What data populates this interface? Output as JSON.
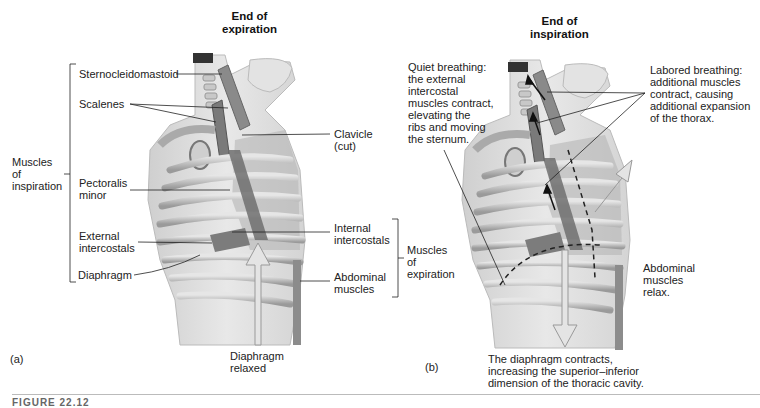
{
  "panel_a": {
    "label": "(a)",
    "title": "End of\nexpiration",
    "group_inspiration": "Muscles\nof\ninspiration",
    "group_expiration": "Muscles\nof\nexpiration",
    "labels": {
      "sternocleidomastoid": "Sternocleidomastoid",
      "scalenes": "Scalenes",
      "clavicle": "Clavicle\n(cut)",
      "pectoralis_minor": "Pectoralis\nminor",
      "external_intercostals": "External\nintercostals",
      "internal_intercostals": "Internal\nintercostals",
      "diaphragm": "Diaphragm",
      "abdominal_muscles": "Abdominal\nmuscles",
      "diaphragm_relaxed": "Diaphragm\nrelaxed"
    }
  },
  "panel_b": {
    "label": "(b)",
    "title": "End of\ninspiration",
    "labels": {
      "quiet_breathing": "Quiet breathing:\nthe external\nintercostal\nmuscles contract,\nelevating the\nribs and moving\nthe sternum.",
      "labored_breathing": "Labored breathing:\nadditional muscles\ncontract, causing\nadditional expansion\nof the thorax.",
      "abdominal_relax": "Abdominal\nmuscles\nrelax.",
      "diaphragm_contracts": "The diaphragm contracts,\nincreasing the superior–inferior\ndimension of the thoracic cavity."
    }
  },
  "figure_caption": "FIGURE 22.12"
}
